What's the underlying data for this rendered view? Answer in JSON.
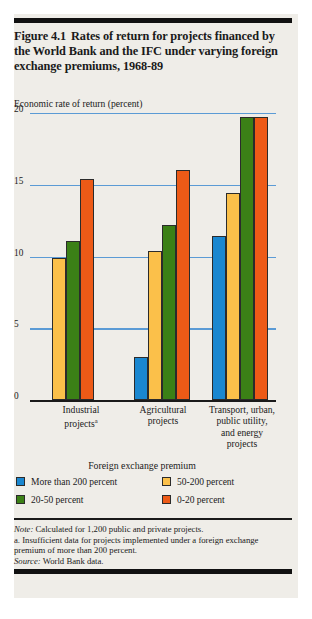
{
  "figure": {
    "title_label": "Figure 4.1",
    "title_text": "Rates of return for projects financed by the World Bank and the IFC under varying foreign exchange premiums, 1968-89",
    "axis_caption": "Economic rate of return (percent)",
    "legend_title": "Foreign exchange premium"
  },
  "notes": {
    "note_label": "Note:",
    "note_text": " Calculated for 1,200 public and private projects.",
    "footnote_a": "a. Insufficient data for projects implemented under a foreign exchange premium of more than 200 percent.",
    "source_label": "Source:",
    "source_text": " World Bank data."
  },
  "chart_data": {
    "type": "bar",
    "xlabel": "Foreign exchange premium",
    "ylabel": "Economic rate of return (percent)",
    "ylim": [
      0,
      20
    ],
    "yticks": [
      0,
      5,
      10,
      15,
      20
    ],
    "ytick_labels": [
      "0",
      "5",
      "10",
      "15",
      "20"
    ],
    "grid": true,
    "grid_color": "#5b9bd5",
    "legend_position": "bottom",
    "categories": [
      "Industrial projects",
      "Agricultural projects",
      "Transport, urban, public utility, and energy projects"
    ],
    "category_lines": [
      [
        "Industrial",
        "projects<sup>a</sup>"
      ],
      [
        "Agricultural",
        "projects"
      ],
      [
        "Transport, urban,",
        "public utility,",
        "and energy",
        "projects"
      ]
    ],
    "series": [
      {
        "name": "More than 200 percent",
        "color": "#1a87d0",
        "values": [
          null,
          3.0,
          11.4
        ]
      },
      {
        "name": "50-200 percent",
        "color": "#fbc04a",
        "values": [
          9.9,
          10.4,
          14.4
        ]
      },
      {
        "name": "20-50 percent",
        "color": "#3b8016",
        "values": [
          11.1,
          12.2,
          19.7
        ]
      },
      {
        "name": "0-20 percent",
        "color": "#ed5a17",
        "values": [
          15.4,
          16.0,
          19.7
        ]
      }
    ]
  }
}
